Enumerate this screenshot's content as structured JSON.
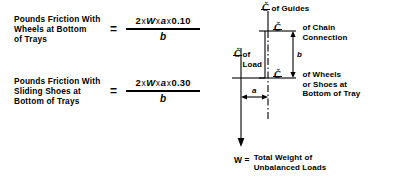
{
  "figure": {
    "formulas": [
      {
        "description": "Pounds Friction With\nWheels at Bottom\nof Trays",
        "equals": "=",
        "numerator_prefix": "2",
        "numerator_var1": "W",
        "numerator_var2": "a",
        "numerator_coefficient": "0.10",
        "multiply": "x",
        "denominator": "b"
      },
      {
        "description": "Pounds Friction With\nSliding Shoes at\nBottom of Trays",
        "equals": "=",
        "numerator_prefix": "2",
        "numerator_var1": "W",
        "numerator_var2": "a",
        "numerator_coefficient": "0.30",
        "multiply": "x",
        "denominator": "b"
      }
    ],
    "diagram": {
      "centerline_symbol": "Č",
      "labels": {
        "guides": "of Guides",
        "chain_connection": "of Chain\nConnection",
        "load": "of\nLoad",
        "wheels_shoes": "of Wheels\nor Shoes at\nBottom of Tray"
      },
      "dimensions": {
        "b": "b",
        "a": "a"
      },
      "weight": {
        "symbol": "W =",
        "description": "Total Weight of\nUnbalanced Loads"
      }
    }
  },
  "colors": {
    "ink": "#000000",
    "background": "#ffffff"
  }
}
